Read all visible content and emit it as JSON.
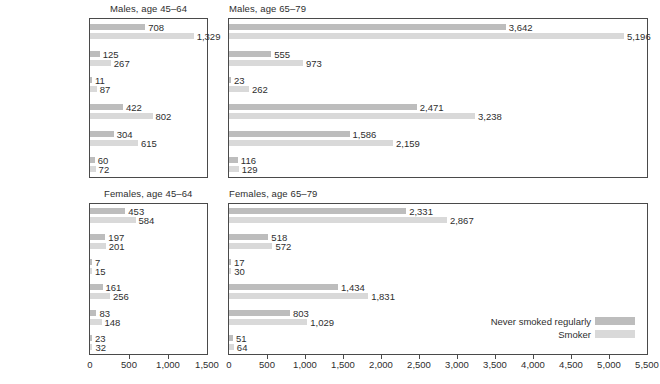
{
  "chart_data": {
    "type": "bar",
    "title": "",
    "orientation": "horizontal",
    "legend": {
      "position": "bottom-right-inside-panel",
      "entries": [
        {
          "label": "Never smoked regularly",
          "color": "#bdbdbd"
        },
        {
          "label": "Smoker",
          "color": "#d9d9d9"
        }
      ]
    },
    "categories": [
      "Deaths from all causes",
      "All cancer",
      "Lung cancer",
      "All heart and circulatory",
      "Coronary heart disease",
      "Violence, accidents, suicide"
    ],
    "panels": [
      {
        "id": "males-45-64",
        "title": "Males, age 45–64",
        "xlabel": "",
        "ylabel": "",
        "xlim": [
          0,
          1500
        ],
        "xticks": [
          0,
          500,
          1000,
          1500
        ],
        "xticklabels": [
          "0",
          "500",
          "1,000",
          "1,500"
        ],
        "grid": false,
        "show_axis": false,
        "show_category_labels": true,
        "series": [
          {
            "name": "Never smoked regularly",
            "color": "#bdbdbd",
            "values": [
              708,
              125,
              11,
              422,
              304,
              60
            ],
            "labels": [
              "708",
              "125",
              "11",
              "422",
              "304",
              "60"
            ]
          },
          {
            "name": "Smoker",
            "color": "#d9d9d9",
            "values": [
              1329,
              267,
              87,
              802,
              615,
              72
            ],
            "labels": [
              "1,329",
              "267",
              "87",
              "802",
              "615",
              "72"
            ]
          }
        ]
      },
      {
        "id": "males-65-79",
        "title": "Males, age 65–79",
        "xlabel": "",
        "ylabel": "",
        "xlim": [
          0,
          5500
        ],
        "xticks": [
          0,
          500,
          1000,
          1500,
          2000,
          2500,
          3000,
          3500,
          4000,
          4500,
          5000,
          5500
        ],
        "xticklabels": [
          "0",
          "500",
          "1,000",
          "1,500",
          "2,000",
          "2,500",
          "3,000",
          "3,500",
          "4,000",
          "4,500",
          "5,000",
          "5,500"
        ],
        "grid": false,
        "show_axis": false,
        "show_category_labels": false,
        "series": [
          {
            "name": "Never smoked regularly",
            "color": "#bdbdbd",
            "values": [
              3642,
              555,
              23,
              2471,
              1586,
              116
            ],
            "labels": [
              "3,642",
              "555",
              "23",
              "2,471",
              "1,586",
              "116"
            ]
          },
          {
            "name": "Smoker",
            "color": "#d9d9d9",
            "values": [
              5196,
              973,
              262,
              3238,
              2159,
              129
            ],
            "labels": [
              "5,196",
              "973",
              "262",
              "3,238",
              "2,159",
              "129"
            ]
          }
        ]
      },
      {
        "id": "females-45-64",
        "title": "Females, age 45–64",
        "xlabel": "",
        "ylabel": "",
        "xlim": [
          0,
          1500
        ],
        "xticks": [
          0,
          500,
          1000,
          1500
        ],
        "xticklabels": [
          "0",
          "500",
          "1,000",
          "1,500"
        ],
        "grid": false,
        "show_axis": true,
        "show_category_labels": true,
        "series": [
          {
            "name": "Never smoked regularly",
            "color": "#bdbdbd",
            "values": [
              453,
              197,
              7,
              161,
              83,
              23
            ],
            "labels": [
              "453",
              "197",
              "7",
              "161",
              "83",
              "23"
            ]
          },
          {
            "name": "Smoker",
            "color": "#d9d9d9",
            "values": [
              584,
              201,
              15,
              256,
              148,
              32
            ],
            "labels": [
              "584",
              "201",
              "15",
              "256",
              "148",
              "32"
            ]
          }
        ]
      },
      {
        "id": "females-65-79",
        "title": "Females, age 65–79",
        "xlabel": "",
        "ylabel": "",
        "xlim": [
          0,
          5500
        ],
        "xticks": [
          0,
          500,
          1000,
          1500,
          2000,
          2500,
          3000,
          3500,
          4000,
          4500,
          5000,
          5500
        ],
        "xticklabels": [
          "0",
          "500",
          "1,000",
          "1,500",
          "2,000",
          "2,500",
          "3,000",
          "3,500",
          "4,000",
          "4,500",
          "5,000",
          "5,500"
        ],
        "grid": false,
        "show_axis": true,
        "show_category_labels": false,
        "series": [
          {
            "name": "Never smoked regularly",
            "color": "#bdbdbd",
            "values": [
              2331,
              518,
              17,
              1434,
              803,
              51
            ],
            "labels": [
              "2,331",
              "518",
              "17",
              "1,434",
              "803",
              "51"
            ]
          },
          {
            "name": "Smoker",
            "color": "#d9d9d9",
            "values": [
              2867,
              572,
              30,
              1831,
              1029,
              64
            ],
            "labels": [
              "2,867",
              "572",
              "30",
              "1,831",
              "1,029",
              "64"
            ]
          }
        ]
      }
    ]
  },
  "colors": {
    "never_smoked": "#bdbdbd",
    "smoker": "#d9d9d9",
    "border": "#4a4a4a",
    "text": "#2e2e2e",
    "background": "#ffffff"
  }
}
